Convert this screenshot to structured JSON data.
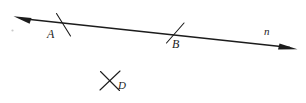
{
  "figure": {
    "type": "geometry-diagram",
    "background_color": "#ffffff",
    "ink_color": "#1c1c1c",
    "labels": {
      "point_a": "A",
      "point_b": "B",
      "point_d": "D",
      "line_n": "n"
    },
    "elements": [
      {
        "name": "line-n",
        "kind": "double-headed-line",
        "label": "n"
      },
      {
        "name": "point-a",
        "kind": "tick-mark-point",
        "label": "A"
      },
      {
        "name": "point-b",
        "kind": "tick-mark-point",
        "label": "B"
      },
      {
        "name": "point-d",
        "kind": "x-mark-point",
        "label": "D"
      }
    ]
  }
}
